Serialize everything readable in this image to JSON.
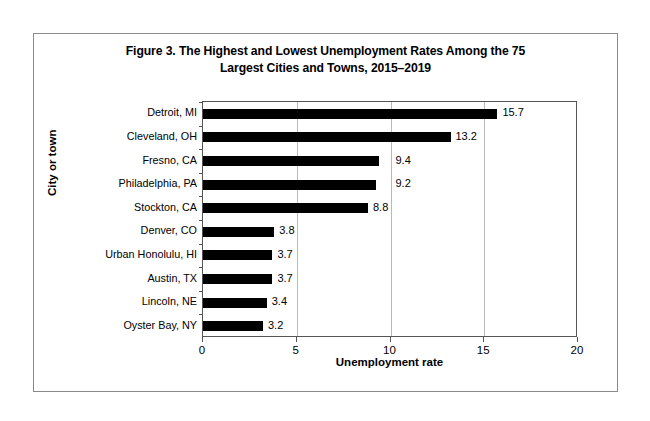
{
  "figure": {
    "title_line1": "Figure 3. The Highest and Lowest Unemployment Rates Among the 75",
    "title_line2": "Largest Cities and Towns, 2015–2019"
  },
  "chart_data": {
    "type": "bar",
    "orientation": "horizontal",
    "title": "Figure 3. The Highest and Lowest Unemployment Rates Among the 75 Largest Cities and Towns, 2015–2019",
    "xlabel": "Unemployment rate",
    "ylabel": "City or town",
    "categories": [
      "Detroit, MI",
      "Cleveland, OH",
      "Fresno, CA",
      "Philadelphia, PA",
      "Stockton, CA",
      "Denver, CO",
      "Urban Honolulu, HI",
      "Austin, TX",
      "Lincoln, NE",
      "Oyster Bay, NY"
    ],
    "values": [
      15.7,
      13.2,
      9.4,
      9.2,
      8.8,
      3.8,
      3.7,
      3.7,
      3.4,
      3.2
    ],
    "value_labels": [
      "15.7",
      "13.2",
      "9.4",
      "9.2",
      "8.8",
      "3.8",
      "3.7",
      "3.7",
      "3.4",
      "3.2"
    ],
    "xlim": [
      0,
      20
    ],
    "xticks": [
      0,
      5,
      10,
      15,
      20
    ],
    "xtick_labels": [
      "0",
      "5",
      "10",
      "15",
      "20"
    ],
    "gridlines": [
      5,
      10,
      15
    ],
    "grid": true,
    "legend": false,
    "bar_color": "#000000",
    "grid_color": "#b9b9b9",
    "axis_color": "#555555"
  }
}
